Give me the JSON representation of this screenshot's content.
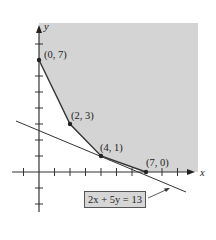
{
  "diagram": {
    "type": "feasible-region",
    "axes": {
      "x_label": "x",
      "y_label": "y"
    },
    "vertices": [
      {
        "label": "(0, 7)",
        "x": 0,
        "y": 7
      },
      {
        "label": "(2, 3)",
        "x": 2,
        "y": 3
      },
      {
        "label": "(4, 1)",
        "x": 4,
        "y": 1
      },
      {
        "label": "(7, 0)",
        "x": 7,
        "y": 0
      }
    ],
    "objective_line": {
      "equation": "2x + 5y = 13"
    },
    "colors": {
      "region_fill": "#d4d4d4",
      "line": "#333333",
      "box_fill": "#d6d6d6"
    }
  }
}
